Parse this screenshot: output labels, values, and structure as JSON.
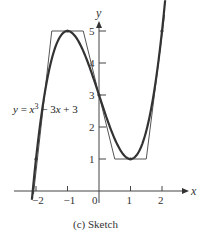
{
  "chart_data": {
    "type": "line",
    "title": "",
    "caption": "(c) Sketch",
    "xlabel": "x",
    "ylabel": "y",
    "xlim": [
      -2.3,
      2.4
    ],
    "ylim": [
      -0.3,
      5.5
    ],
    "x_ticks": [
      -2,
      -1,
      0,
      1,
      2
    ],
    "x_tick_labels": [
      "-2",
      "-1",
      "0",
      "1",
      "2"
    ],
    "y_ticks": [
      1,
      2,
      3,
      4,
      5
    ],
    "y_tick_labels": [
      "1",
      "2",
      "3",
      "4",
      "5"
    ],
    "grid": false,
    "annotation": "y = x³ − 3x + 3",
    "series": [
      {
        "name": "curve",
        "label": "y = x^3 - 3x + 3",
        "function": "x^3 - 3x + 3",
        "x_range": [
          -2.13,
          2.1
        ],
        "style": "thick"
      },
      {
        "name": "sketch-polygon",
        "style": "thin",
        "points": [
          [
            -2.08,
            -0.1
          ],
          [
            -1.5,
            5
          ],
          [
            -0.5,
            5
          ],
          [
            0.5,
            1
          ],
          [
            1.5,
            1
          ],
          [
            2.08,
            5.5
          ]
        ]
      }
    ],
    "marked_points": [
      [
        -2,
        1
      ],
      [
        -1,
        5
      ],
      [
        0,
        3
      ],
      [
        1,
        1
      ],
      [
        2,
        5
      ]
    ]
  }
}
